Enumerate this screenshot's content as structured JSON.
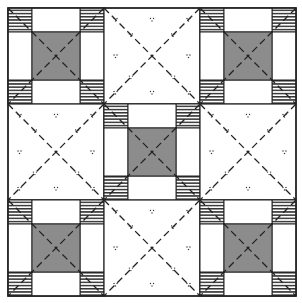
{
  "canvas": {
    "width": 302,
    "height": 303
  },
  "grid": {
    "origin_x": 8,
    "origin_y": 8,
    "block_size": 96,
    "rows": 3,
    "cols": 3
  },
  "colors": {
    "background": "#ffffff",
    "line": "#222222",
    "center_fill": "#8c8c8c",
    "stripe": "#333333",
    "dot": "#333333"
  },
  "layout": [
    [
      "nine-patch",
      "plain",
      "nine-patch"
    ],
    [
      "plain",
      "nine-patch",
      "plain"
    ],
    [
      "nine-patch",
      "plain",
      "nine-patch"
    ]
  ],
  "block_types": {
    "nine-patch": {
      "corner_fraction": 0.25,
      "corner_pattern": "horizontal-stripes",
      "edge_fill": "white",
      "center_fraction": 0.5,
      "center_fill": "gray"
    },
    "plain": {
      "fill": "white",
      "pattern": "scattered-dot-triads"
    }
  },
  "overlay": {
    "diagonals": "dashed",
    "per_block": true
  },
  "dot_positions": [
    [
      0.5,
      0.12
    ],
    [
      0.12,
      0.12
    ],
    [
      0.88,
      0.12
    ],
    [
      0.28,
      0.28
    ],
    [
      0.72,
      0.28
    ],
    [
      0.12,
      0.5
    ],
    [
      0.88,
      0.5
    ],
    [
      0.28,
      0.72
    ],
    [
      0.72,
      0.72
    ],
    [
      0.12,
      0.88
    ],
    [
      0.5,
      0.88
    ],
    [
      0.88,
      0.88
    ]
  ]
}
